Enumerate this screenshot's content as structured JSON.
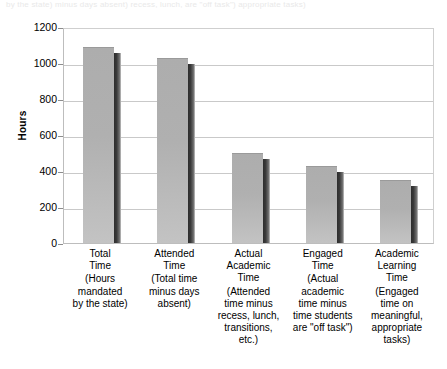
{
  "caption_remnant": "by the state) minus days absent) recess, lunch, are \"off task\") appropriate tasks)",
  "chart_data": {
    "type": "bar",
    "title": "",
    "xlabel": "",
    "ylabel": "Hours",
    "ylim": [
      0,
      1200
    ],
    "ytick_step": 200,
    "yticks": [
      1200,
      1000,
      800,
      600,
      400,
      200,
      0
    ],
    "ytick_labels": [
      "1200",
      "1000",
      "800",
      "600",
      "400",
      "200",
      "0"
    ],
    "grid": true,
    "legend": "none",
    "style": "3d-shadowed-gray-bars",
    "categories": [
      "Total Time",
      "Attended Time",
      "Actual Academic Time",
      "Engaged Time",
      "Academic Learning Time"
    ],
    "category_titles": [
      "Total\nTime",
      "Attended\nTime",
      "Actual\nAcademic\nTime",
      "Engaged\nTime",
      "Academic\nLearning\nTime"
    ],
    "category_descriptions": [
      "(Hours\nmandated\nby the state)",
      "(Total time\nminus days\nabsent)",
      "(Attended\ntime minus\nrecess, lunch,\ntransitions,\netc.)",
      "(Actual\nacademic\ntime minus\ntime students\nare \"off task\")",
      "(Engaged\ntime on\nmeaningful,\nappropriate\ntasks)"
    ],
    "values": [
      1090,
      1030,
      500,
      430,
      350
    ],
    "colors": {
      "bar_face": "#b0b0b0",
      "bar_shadow": "#343434",
      "gridline": "#c9c9c9",
      "frame": "#bdbdbd",
      "text": "#000000"
    }
  }
}
